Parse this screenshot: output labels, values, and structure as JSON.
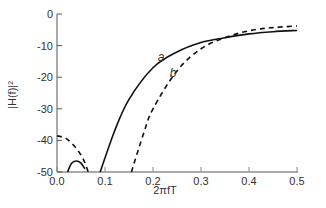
{
  "chart_data": {
    "type": "line",
    "title": "",
    "xlabel": "2πfT",
    "ylabel": "|H(f)|²",
    "xlim": [
      0.0,
      0.5
    ],
    "ylim": [
      -50,
      0
    ],
    "xticks": [
      "0.0",
      "0.1",
      "0.2",
      "0.3",
      "0.4",
      "0.5"
    ],
    "yticks": [
      "0",
      "-10",
      "-20",
      "-30",
      "-40",
      "-50"
    ],
    "grid": false,
    "legend": "none (inline curve labels a, b)",
    "series": [
      {
        "name": "a",
        "style": "solid",
        "segments": [
          {
            "x": [
              0.022,
              0.03,
              0.04,
              0.05,
              0.058
            ],
            "y": [
              -50,
              -47.3,
              -46.5,
              -47.2,
              -49
            ]
          },
          {
            "x": [
              0.09,
              0.12,
              0.15,
              0.2,
              0.25,
              0.3,
              0.35,
              0.4,
              0.45,
              0.5
            ],
            "y": [
              -50,
              -37,
              -27,
              -17,
              -12,
              -9,
              -7.5,
              -6.3,
              -5.6,
              -5.2
            ]
          }
        ]
      },
      {
        "name": "b",
        "style": "dashed",
        "segments": [
          {
            "x": [
              0.0,
              0.02,
              0.04,
              0.055,
              0.065
            ],
            "y": [
              -38.5,
              -39.5,
              -42.5,
              -46,
              -50
            ]
          },
          {
            "x": [
              0.155,
              0.18,
              0.2,
              0.25,
              0.3,
              0.35,
              0.4,
              0.45,
              0.5
            ],
            "y": [
              -50,
              -38,
              -30,
              -18,
              -11,
              -7.5,
              -5.3,
              -4.3,
              -3.8
            ]
          }
        ]
      }
    ],
    "annotations": [
      {
        "text": "a",
        "x": 0.21,
        "y": -15
      },
      {
        "text": "b",
        "x": 0.235,
        "y": -20
      }
    ]
  }
}
